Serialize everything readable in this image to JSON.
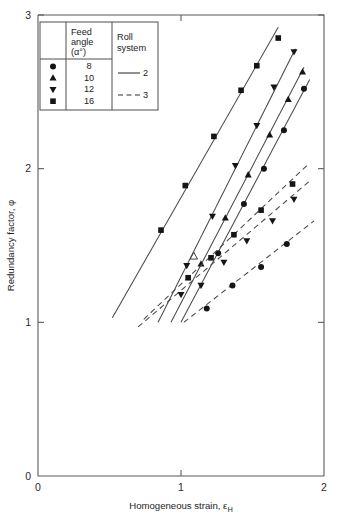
{
  "figure": {
    "background": "#ffffff",
    "ink_color": "#1a1a1a",
    "axis_color": "#5b5b5b"
  },
  "legend": {
    "headers": {
      "symbol": "",
      "feed_angle_line1": "Feed",
      "feed_angle_line2": "angle",
      "feed_angle_line3": "(α°)",
      "roll_system_line1": "Roll",
      "roll_system_line2": "system"
    },
    "rows": [
      {
        "marker": "circle",
        "feed_angle": "8"
      },
      {
        "marker": "triangle-up",
        "feed_angle": "10"
      },
      {
        "marker": "triangle-down",
        "feed_angle": "12"
      },
      {
        "marker": "square",
        "feed_angle": "16"
      }
    ],
    "roll_systems": [
      {
        "style": "solid",
        "label": "2"
      },
      {
        "style": "dashed",
        "label": "3"
      }
    ]
  },
  "chart_data": {
    "type": "scatter",
    "title": "",
    "xlabel": "Homogeneous strain, εH",
    "ylabel": "Redundancy factor, φ",
    "xlim": [
      0,
      2
    ],
    "ylim": [
      0,
      3
    ],
    "xticks": [
      "0",
      "1",
      "2"
    ],
    "xtick_values": [
      0,
      1,
      2
    ],
    "yticks": [
      "0",
      "1",
      "2",
      "3"
    ],
    "ytick_values": [
      0,
      1,
      2,
      3
    ],
    "grid": false,
    "legend_position": "top-left-inset",
    "series": [
      {
        "name": "16°, roll system 2",
        "marker": "square",
        "line_style": "solid",
        "roll_system": "2",
        "feed_angle": 16,
        "fit_line": {
          "x": [
            0.52,
            1.68
          ],
          "y": [
            1.03,
            2.92
          ]
        },
        "points": [
          {
            "x": 0.86,
            "y": 1.6
          },
          {
            "x": 1.03,
            "y": 1.89
          },
          {
            "x": 1.23,
            "y": 2.21
          },
          {
            "x": 1.42,
            "y": 2.51
          },
          {
            "x": 1.53,
            "y": 2.67
          },
          {
            "x": 1.68,
            "y": 2.85
          }
        ]
      },
      {
        "name": "12°, roll system 2",
        "marker": "triangle-down",
        "line_style": "solid",
        "roll_system": "2",
        "feed_angle": 12,
        "fit_line": {
          "x": [
            0.84,
            1.8
          ],
          "y": [
            1.0,
            2.78
          ]
        },
        "points": [
          {
            "x": 1.04,
            "y": 1.37
          },
          {
            "x": 1.22,
            "y": 1.69
          },
          {
            "x": 1.38,
            "y": 2.02
          },
          {
            "x": 1.53,
            "y": 2.28
          },
          {
            "x": 1.65,
            "y": 2.53
          },
          {
            "x": 1.79,
            "y": 2.76
          }
        ]
      },
      {
        "name": "10°, roll system 2",
        "marker": "triangle-up",
        "line_style": "solid",
        "roll_system": "2",
        "feed_angle": 10,
        "fit_line": {
          "x": [
            0.93,
            1.86
          ],
          "y": [
            1.0,
            2.66
          ]
        },
        "points": [
          {
            "x": 1.14,
            "y": 1.38
          },
          {
            "x": 1.31,
            "y": 1.68
          },
          {
            "x": 1.47,
            "y": 1.96
          },
          {
            "x": 1.62,
            "y": 2.22
          },
          {
            "x": 1.75,
            "y": 2.45
          },
          {
            "x": 1.85,
            "y": 2.63
          }
        ]
      },
      {
        "name": "8°, roll system 2",
        "marker": "circle",
        "line_style": "solid",
        "roll_system": "2",
        "feed_angle": 8,
        "fit_line": {
          "x": [
            1.0,
            1.9
          ],
          "y": [
            1.0,
            2.58
          ]
        },
        "points": [
          {
            "x": 1.26,
            "y": 1.45
          },
          {
            "x": 1.44,
            "y": 1.77
          },
          {
            "x": 1.58,
            "y": 2.0
          },
          {
            "x": 1.72,
            "y": 2.25
          },
          {
            "x": 1.86,
            "y": 2.52
          }
        ]
      },
      {
        "name": "16° / 12°, roll system 3",
        "marker": "square",
        "line_style": "dashed",
        "roll_system": "3",
        "feed_angle": 16,
        "fit_line": {
          "x": [
            0.74,
            1.88
          ],
          "y": [
            1.02,
            2.02
          ]
        },
        "points": [
          {
            "x": 1.05,
            "y": 1.29
          },
          {
            "x": 1.21,
            "y": 1.42
          },
          {
            "x": 1.37,
            "y": 1.57
          },
          {
            "x": 1.56,
            "y": 1.73
          },
          {
            "x": 1.78,
            "y": 1.9
          }
        ]
      },
      {
        "name": "12°, roll system 3",
        "marker": "triangle-down",
        "line_style": "dashed",
        "roll_system": "3",
        "feed_angle": 12,
        "fit_line": {
          "x": [
            0.7,
            1.9
          ],
          "y": [
            0.97,
            1.92
          ]
        },
        "points": [
          {
            "x": 1.0,
            "y": 1.18
          },
          {
            "x": 1.14,
            "y": 1.24
          },
          {
            "x": 1.3,
            "y": 1.39
          },
          {
            "x": 1.46,
            "y": 1.53
          },
          {
            "x": 1.64,
            "y": 1.66
          },
          {
            "x": 1.79,
            "y": 1.8
          }
        ]
      },
      {
        "name": "8°, roll system 3",
        "marker": "circle",
        "line_style": "dashed",
        "roll_system": "3",
        "feed_angle": 8,
        "fit_line": {
          "x": [
            1.02,
            1.93
          ],
          "y": [
            1.0,
            1.66
          ]
        },
        "points": [
          {
            "x": 1.18,
            "y": 1.09
          },
          {
            "x": 1.36,
            "y": 1.24
          },
          {
            "x": 1.56,
            "y": 1.36
          },
          {
            "x": 1.74,
            "y": 1.51
          }
        ]
      },
      {
        "name": "outlier open marker",
        "marker": "triangle-up-open",
        "line_style": "none",
        "roll_system": "",
        "feed_angle": 10,
        "points": [
          {
            "x": 1.09,
            "y": 1.43
          }
        ]
      }
    ]
  }
}
